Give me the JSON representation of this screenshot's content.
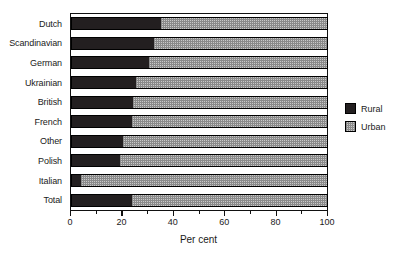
{
  "chart_data": {
    "type": "bar",
    "orientation": "horizontal",
    "stacked": true,
    "title": "",
    "subtitle": "",
    "xlabel": "Per cent",
    "ylabel": "",
    "xlim": [
      0,
      100
    ],
    "xticks": [
      0,
      20,
      40,
      60,
      80,
      100
    ],
    "xtick_labels": [
      "0",
      "20",
      "40",
      "60",
      "80",
      "100"
    ],
    "minor_ticks": [
      10,
      30,
      50,
      70,
      90
    ],
    "grid": false,
    "legend_position": "right",
    "categories": [
      "Dutch",
      "Scandinavian",
      "German",
      "Ukrainian",
      "British",
      "French",
      "Other",
      "Polish",
      "Italian",
      "Total"
    ],
    "series": [
      {
        "name": "Rural",
        "color": "#231f20",
        "values": [
          35,
          32,
          30,
          25,
          24,
          23.5,
          20,
          19,
          3.5,
          23.5
        ]
      },
      {
        "name": "Urban",
        "color": "#c9c9c9",
        "values": [
          65,
          68,
          70,
          75,
          76,
          76.5,
          80,
          81,
          96.5,
          76.5
        ]
      }
    ]
  },
  "legend": {
    "entries": [
      {
        "label": "Rural",
        "swatch": "rural"
      },
      {
        "label": "Urban",
        "swatch": "urban"
      }
    ]
  },
  "colors": {
    "rural": "#231f20",
    "urban": "#c9c9c9",
    "axis": "#111111",
    "background": "#ffffff"
  }
}
